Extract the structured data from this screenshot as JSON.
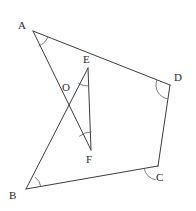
{
  "figure": {
    "canvas": {
      "width": 196,
      "height": 211,
      "background": "#ffffff"
    },
    "stroke_color": "#3d3d3d",
    "arc_color": "#6b6b6b",
    "label_color": "#2b2b2b",
    "points": [
      {
        "id": "A",
        "label": "A",
        "x": 33,
        "y": 31,
        "label_x": 18,
        "label_y": 20
      },
      {
        "id": "B",
        "label": "B",
        "x": 26,
        "y": 189,
        "label_x": 9,
        "label_y": 190
      },
      {
        "id": "C",
        "label": "C",
        "x": 158,
        "y": 166,
        "label_x": 156,
        "label_y": 172
      },
      {
        "id": "D",
        "label": "D",
        "x": 170,
        "y": 85,
        "label_x": 174,
        "label_y": 72
      },
      {
        "id": "E",
        "label": "E",
        "x": 88,
        "y": 68,
        "label_x": 83,
        "label_y": 54
      },
      {
        "id": "F",
        "label": "F",
        "x": 91,
        "y": 150,
        "label_x": 86,
        "label_y": 154
      },
      {
        "id": "O",
        "label": "O",
        "x": 72,
        "y": 104,
        "label_x": 62,
        "label_y": 82
      }
    ],
    "segments": [
      {
        "id": "AD",
        "from": "A",
        "to": "D"
      },
      {
        "id": "AF",
        "from": "A",
        "to": "F"
      },
      {
        "id": "BE",
        "from": "B",
        "to": "E"
      },
      {
        "id": "BC",
        "from": "B",
        "to": "C"
      },
      {
        "id": "CD",
        "from": "C",
        "to": "D"
      },
      {
        "id": "EF",
        "from": "E",
        "to": "F"
      }
    ],
    "angle_arcs": [
      {
        "id": "angle-A",
        "vertex": "A",
        "radius": 16,
        "start_deg": 21,
        "end_deg": 70
      },
      {
        "id": "angle-B",
        "vertex": "B",
        "radius": 15,
        "start_deg": -9,
        "end_deg": -53
      },
      {
        "id": "angle-C",
        "vertex": "C",
        "radius": 14,
        "start_deg": 171,
        "end_deg": 99
      },
      {
        "id": "angle-D",
        "vertex": "D",
        "radius": 14,
        "start_deg": 201,
        "end_deg": 99
      },
      {
        "id": "angle-E",
        "vertex": "E",
        "radius": 18,
        "start_deg": 88,
        "end_deg": 123
      },
      {
        "id": "angle-F",
        "vertex": "F",
        "radius": 18,
        "start_deg": -88,
        "end_deg": -131
      }
    ]
  }
}
